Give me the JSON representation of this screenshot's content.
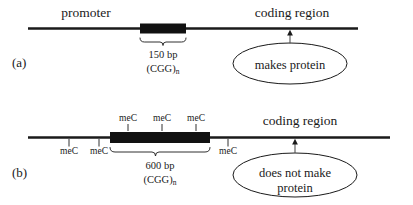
{
  "figure": {
    "type": "gene-methylation-diagram",
    "background_color": "#ffffff",
    "ink_color": "#1a1a1a"
  },
  "panels": [
    {
      "id": "a",
      "label": "(a)",
      "promoter_label": "promoter",
      "coding_label": "coding region",
      "repeat_size_label": "150 bp",
      "repeat_unit_label": "(CGG)",
      "repeat_unit_subscript": "n",
      "outcome_lines": [
        "makes protein"
      ],
      "methylation_marks": []
    },
    {
      "id": "b",
      "label": "(b)",
      "promoter_label": "",
      "coding_label": "coding region",
      "repeat_size_label": "600 bp",
      "repeat_unit_label": "(CGG)",
      "repeat_unit_subscript": "n",
      "outcome_lines": [
        "does not make",
        "protein"
      ],
      "methylation_marks": [
        {
          "label": "meC",
          "position": "below-left-1"
        },
        {
          "label": "meC",
          "position": "below-left-2"
        },
        {
          "label": "meC",
          "position": "above-repeat-1"
        },
        {
          "label": "meC",
          "position": "above-repeat-2"
        },
        {
          "label": "meC",
          "position": "above-repeat-3"
        },
        {
          "label": "meC",
          "position": "below-right-1"
        }
      ]
    }
  ]
}
